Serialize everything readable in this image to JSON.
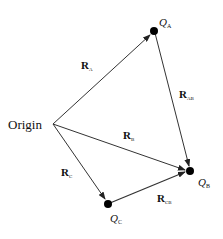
{
  "diagram": {
    "origin": {
      "label": "Origin",
      "x": 53,
      "y": 124
    },
    "charges": [
      {
        "id": "A",
        "symbol": "Q",
        "subscript": "A",
        "x": 154,
        "y": 31
      },
      {
        "id": "B",
        "symbol": "Q",
        "subscript": "B",
        "x": 190,
        "y": 171
      },
      {
        "id": "C",
        "symbol": "Q",
        "subscript": "C",
        "x": 108,
        "y": 204
      }
    ],
    "vectors": [
      {
        "name": "R",
        "subscript": "A",
        "from": "Origin",
        "to": "A"
      },
      {
        "name": "R",
        "subscript": "B",
        "from": "Origin",
        "to": "B"
      },
      {
        "name": "R",
        "subscript": "C",
        "from": "Origin",
        "to": "C"
      },
      {
        "name": "R",
        "subscript": "AB",
        "from": "A",
        "to": "B"
      },
      {
        "name": "R",
        "subscript": "CB",
        "from": "C",
        "to": "B"
      }
    ],
    "colors": {
      "line": "#333333",
      "dot": "#000000",
      "background": "#ffffff"
    }
  }
}
